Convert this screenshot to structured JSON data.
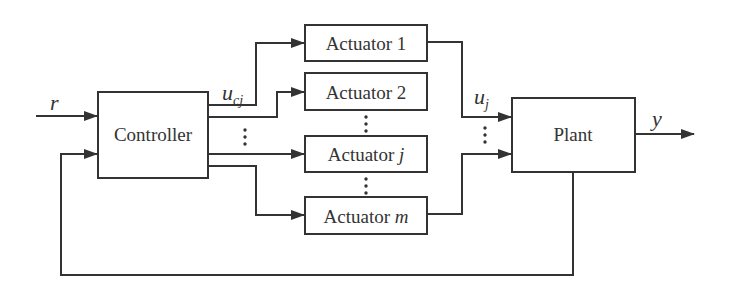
{
  "diagram": {
    "type": "block-diagram",
    "blocks": {
      "controller": {
        "label": "Controller"
      },
      "actuator_1": {
        "label": "Actuator 1"
      },
      "actuator_2": {
        "label": "Actuator 2"
      },
      "actuator_j": {
        "label_prefix": "Actuator ",
        "label_var": "j"
      },
      "actuator_m": {
        "label_prefix": "Actuator ",
        "label_var": "m"
      },
      "plant": {
        "label": "Plant"
      }
    },
    "signals": {
      "reference": "r",
      "controller_output_main": "u",
      "controller_output_sub": "cj",
      "actuator_output_main": "u",
      "actuator_output_sub": "j",
      "output": "y"
    },
    "connections": [
      {
        "from": "r",
        "to": "controller"
      },
      {
        "from": "controller",
        "to": "actuator_1"
      },
      {
        "from": "controller",
        "to": "actuator_2"
      },
      {
        "from": "controller",
        "to": "actuator_j"
      },
      {
        "from": "controller",
        "to": "actuator_m"
      },
      {
        "from": "actuator_1",
        "to": "plant"
      },
      {
        "from": "actuator_m",
        "to": "plant"
      },
      {
        "from": "plant",
        "to": "y"
      },
      {
        "from": "plant",
        "to": "controller",
        "kind": "feedback"
      }
    ],
    "colors": {
      "line": "#333333",
      "background": "#ffffff"
    }
  }
}
